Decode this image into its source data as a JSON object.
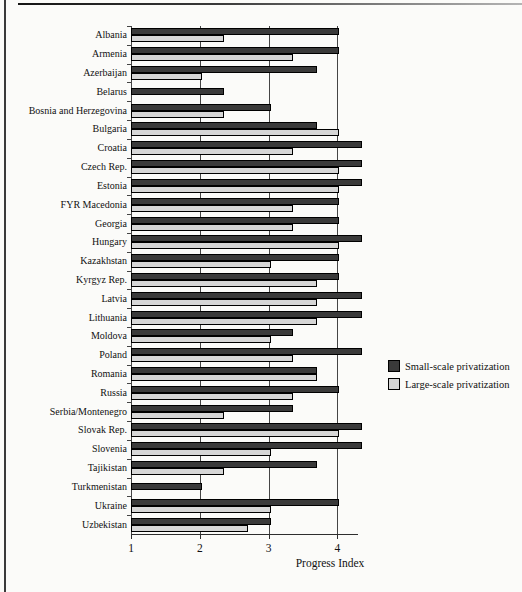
{
  "colors": {
    "background": "#fbfbf9",
    "small_scale_bar": "#3a3a3a",
    "large_scale_bar": "#d6d6d6",
    "bar_border": "#000000",
    "gridline": "#454545",
    "frame_line": "#3a3a3a"
  },
  "chart_data": {
    "type": "bar",
    "orientation": "horizontal",
    "title": "",
    "xlabel": "Progress Index",
    "ylabel": "",
    "x_ticks": [
      1,
      2,
      3,
      4
    ],
    "x_range": [
      1,
      4.3
    ],
    "grid": "vertical",
    "legend_position": "right",
    "categories": [
      "Albania",
      "Armenia",
      "Azerbaijan",
      "Belarus",
      "Bosnia and Herzegovina",
      "Bulgaria",
      "Croatia",
      "Czech Rep.",
      "Estonia",
      "FYR Macedonia",
      "Georgia",
      "Hungary",
      "Kazakhstan",
      "Kyrgyz Rep.",
      "Latvia",
      "Lithuania",
      "Moldova",
      "Poland",
      "Romania",
      "Russia",
      "Serbia/Montenegro",
      "Slovak Rep.",
      "Slovenia",
      "Tajikistan",
      "Turkmenistan",
      "Ukraine",
      "Uzbekistan"
    ],
    "series": [
      {
        "name": "Small-scale privatization",
        "color": "#3a3a3a",
        "values": [
          4,
          4,
          3.67,
          2.33,
          3,
          3.67,
          4.33,
          4.33,
          4.33,
          4,
          4,
          4.33,
          4,
          4,
          4.33,
          4.33,
          3.33,
          4.33,
          3.67,
          4,
          3.33,
          4.33,
          4.33,
          3.67,
          2,
          4,
          3
        ]
      },
      {
        "name": "Large-scale privatization",
        "color": "#d6d6d6",
        "values": [
          2.33,
          3.33,
          2,
          1,
          2.33,
          4,
          3.33,
          4,
          4,
          3.33,
          3.33,
          4,
          3,
          3.67,
          3.67,
          3.67,
          3,
          3.33,
          3.67,
          3.33,
          2.33,
          4,
          3,
          2.33,
          1,
          3,
          2.67
        ]
      }
    ]
  }
}
